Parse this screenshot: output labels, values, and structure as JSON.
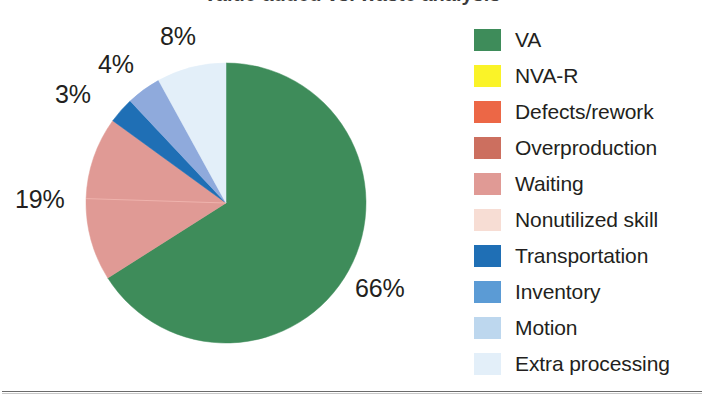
{
  "figure": {
    "title_clipped": "Value-added vs. waste analysis",
    "width": 704,
    "height": 399
  },
  "chart_data": {
    "type": "pie",
    "title": "Value-added vs. waste analysis",
    "xlabel": "",
    "ylabel": "",
    "legend_position": "right",
    "grid": false,
    "start_angle_deg": 0,
    "direction": "clockwise",
    "categories": [
      "VA",
      "NVA-R",
      "Defects/rework",
      "Overproduction",
      "Waiting",
      "Nonutilized skill",
      "Transportation",
      "Inventory",
      "Motion",
      "Extra processing"
    ],
    "values": [
      66,
      0,
      0,
      0,
      19,
      0,
      3,
      4,
      8,
      0
    ],
    "value_unit": "%",
    "colors": [
      "#3E8C5A",
      "#FAF328",
      "#EC6746",
      "#CC6F5F",
      "#E09A95",
      "#F7DDD4",
      "#1F6FB5",
      "#5B9BD5",
      "#BDD7EE",
      "#E3EFF9"
    ],
    "slices": [
      {
        "label": "VA",
        "value": 66,
        "color": "#3E8C5A",
        "display": "66%"
      },
      {
        "label": "Waiting",
        "value": 19,
        "color": "#E09A95",
        "display": "19%"
      },
      {
        "label": "Transportation",
        "value": 3,
        "color": "#1F6FB5",
        "display": "3%"
      },
      {
        "label": "Inventory",
        "value": 4,
        "color": "#8FAADC",
        "display": "4%"
      },
      {
        "label": "Motion",
        "value": 8,
        "color": "#E3EFF9",
        "display": "8%"
      }
    ],
    "data_labels": [
      "66%",
      "19%",
      "3%",
      "4%",
      "8%"
    ],
    "annotations": [
      {
        "text": "66%",
        "slice": "VA"
      },
      {
        "text": "19%",
        "slice": "Waiting"
      },
      {
        "text": "3%",
        "slice": "Transportation"
      },
      {
        "text": "4%",
        "slice": "Inventory"
      },
      {
        "text": "8%",
        "slice": "Motion"
      }
    ]
  },
  "pie": {
    "labels": {
      "va": "66%",
      "waiting": "19%",
      "transportation": "3%",
      "inventory": "4%",
      "motion": "8%"
    }
  },
  "legend": {
    "items": [
      {
        "label": "VA",
        "color": "#3E8C5A"
      },
      {
        "label": "NVA-R",
        "color": "#FAF328"
      },
      {
        "label": "Defects/rework",
        "color": "#EC6746"
      },
      {
        "label": "Overproduction",
        "color": "#CC6F5F"
      },
      {
        "label": "Waiting",
        "color": "#E09A95"
      },
      {
        "label": "Nonutilized skill",
        "color": "#F7DDD4"
      },
      {
        "label": "Transportation",
        "color": "#1F6FB5"
      },
      {
        "label": "Inventory",
        "color": "#5B9BD5"
      },
      {
        "label": "Motion",
        "color": "#BDD7EE"
      },
      {
        "label": "Extra processing",
        "color": "#E3EFF9"
      }
    ]
  }
}
